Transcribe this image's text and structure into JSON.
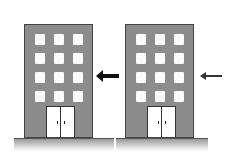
{
  "diagram": {
    "buildings": [
      {
        "id": "left",
        "windows_rows": 4,
        "windows_cols": 3,
        "door": "double",
        "arrow": "thick"
      },
      {
        "id": "right",
        "windows_rows": 4,
        "windows_cols": 3,
        "door": "double",
        "arrow": "thin"
      }
    ],
    "colors": {
      "building": "#8c8c8c",
      "window": "#fafafa",
      "arrow": "#111111"
    }
  }
}
